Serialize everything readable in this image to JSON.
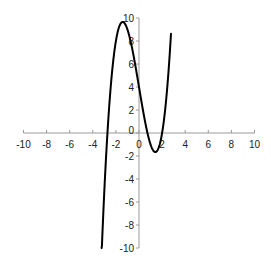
{
  "chart_data": {
    "type": "line",
    "title": "",
    "xlabel": "",
    "ylabel": "",
    "function": "y = x^3 - 6x + 4",
    "xlim": [
      -10,
      10
    ],
    "ylim": [
      -10,
      10
    ],
    "grid": false,
    "legend": null,
    "x_ticks": [
      -10,
      -8,
      -6,
      -4,
      -2,
      0,
      2,
      4,
      6,
      8,
      10
    ],
    "y_ticks": [
      -10,
      -8,
      -6,
      -4,
      -2,
      0,
      2,
      4,
      6,
      8,
      10
    ],
    "x_tick_labels": [
      "-10",
      "-8",
      "-6",
      "-4",
      "-2",
      "0",
      "2",
      "4",
      "6",
      "8",
      "10"
    ],
    "y_tick_labels": [
      "-10",
      "-8",
      "-6",
      "-4",
      "-2",
      "0",
      "2",
      "4",
      "6",
      "8",
      "10"
    ],
    "series": [
      {
        "name": "curve",
        "color": "#000000",
        "x": [
          -3.24,
          -3.0,
          -2.8,
          -2.6,
          -2.4,
          -2.2,
          -2.0,
          -1.8,
          -1.6,
          -1.41,
          -1.2,
          -1.0,
          -0.8,
          -0.6,
          -0.4,
          -0.2,
          0.0,
          0.2,
          0.4,
          0.6,
          0.8,
          1.0,
          1.2,
          1.41,
          1.6,
          1.8,
          2.0,
          2.2,
          2.4,
          2.6,
          2.77
        ],
        "values": [
          -10.0,
          -5.0,
          -1.15,
          2.02,
          4.58,
          6.55,
          8.0,
          8.97,
          9.5,
          9.66,
          9.47,
          9.0,
          8.29,
          7.38,
          6.34,
          5.19,
          4.0,
          2.81,
          1.66,
          0.62,
          -0.29,
          -1.0,
          -1.47,
          -1.66,
          -1.5,
          -0.97,
          0.0,
          1.45,
          3.42,
          5.98,
          8.63
        ]
      }
    ],
    "annotations": [
      {
        "label": "local maximum",
        "x": -1.41,
        "y": 9.66
      },
      {
        "label": "local minimum",
        "x": 1.41,
        "y": -1.66
      }
    ]
  },
  "colors": {
    "axis": "#9a9a9a",
    "curve": "#000000",
    "labels": "#222222"
  }
}
